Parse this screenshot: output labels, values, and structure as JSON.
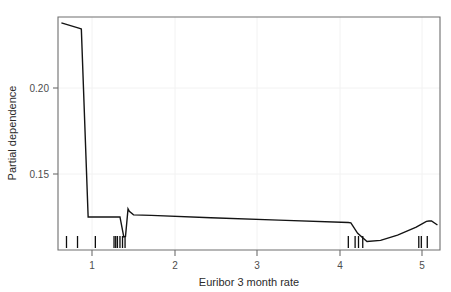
{
  "chart_data": {
    "type": "line",
    "title": "",
    "subtitle": "",
    "xlabel": "Euribor 3 month rate",
    "ylabel": "Partial dependence",
    "xlim": [
      0.6,
      5.1
    ],
    "ylim": [
      0.108,
      0.2405
    ],
    "xticks": [
      1,
      2,
      3,
      4,
      5
    ],
    "xtick_labels": [
      "1",
      "2",
      "3",
      "4",
      "5"
    ],
    "yticks": [
      0.15,
      0.2
    ],
    "ytick_labels": [
      "0.15",
      "0.20"
    ],
    "grid": true,
    "legend": null,
    "legend_position": "none",
    "line_color": "#141414",
    "axis_color": "#6e6e6e",
    "grid_color": "#f2f2f2",
    "background_color": "#ffffff",
    "series": [
      {
        "name": "Partial dependence",
        "x": [
          0.64,
          0.855,
          0.875,
          0.955,
          1.28,
          1.33,
          1.375,
          1.395,
          1.425,
          1.44,
          1.49,
          1.7,
          2.4,
          3.2,
          4.02,
          4.05,
          4.13,
          4.24,
          4.4,
          4.6,
          4.82,
          4.94,
          4.97,
          5.0,
          5.07
        ],
        "y": [
          0.2372,
          0.234,
          0.2337,
          0.1268,
          0.1268,
          0.1268,
          0.1155,
          0.1157,
          0.1314,
          0.13,
          0.128,
          0.1277,
          0.1263,
          0.125,
          0.1236,
          0.1234,
          0.1175,
          0.1128,
          0.1135,
          0.1165,
          0.121,
          0.1243,
          0.1245,
          0.1245,
          0.1222
        ]
      }
    ],
    "rug_marks": [
      0.7,
      0.83,
      1.04,
      1.26,
      1.28,
      1.3,
      1.33,
      1.36,
      1.39,
      4.02,
      4.1,
      4.14,
      4.19,
      4.85,
      4.88,
      4.95
    ]
  },
  "axes": {
    "x_title": "Euribor 3 month rate",
    "y_title": "Partial dependence"
  }
}
